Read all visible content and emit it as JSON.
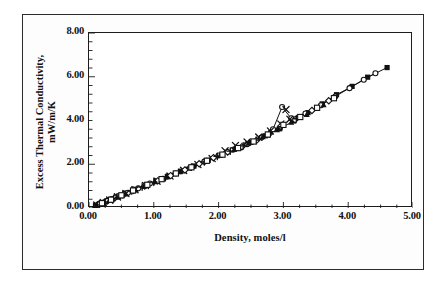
{
  "figure": {
    "kind": "scanned-scientific-chart",
    "background": "#ffffff",
    "border_color": "#2b2b2b"
  },
  "axes": {
    "y_title_line1": "Excess Thermal Conductivity,",
    "y_title_line2": "mW/m/K",
    "x_title": "Density, moles/l",
    "y_ticks": [
      "8.00",
      "6.00",
      "4.00",
      "2.00",
      "0.00"
    ],
    "x_ticks": [
      "0.00",
      "1.00",
      "2.00",
      "3.00",
      "4.00",
      "5.00"
    ]
  },
  "chart_data": {
    "type": "scatter",
    "title": "",
    "subtitle": "",
    "xlabel": "Density, moles/l",
    "ylabel": "Excess Thermal Conductivity, mW/m/K",
    "xlim": [
      0.0,
      5.0
    ],
    "ylim": [
      0.0,
      8.0
    ],
    "x_major_step": 1.0,
    "y_major_step": 2.0,
    "x_minor_step": 0.25,
    "y_minor_step": 0.4,
    "grid": false,
    "legend": "none",
    "marker_color": "#111111",
    "line_color": "#111111",
    "annotations": [
      "Divergent upper branch of open-circle and x-cross points near density 3.0, excess conductivity 4.5-4.7",
      "Data collapse onto a single near-linear excess-conductivity curve"
    ],
    "series": [
      {
        "name": "series-1-filled-square",
        "marker": "filled-square",
        "connected": true,
        "points": [
          [
            0.1,
            0.12
          ],
          [
            0.18,
            0.2
          ],
          [
            0.27,
            0.31
          ],
          [
            0.36,
            0.42
          ],
          [
            0.46,
            0.55
          ],
          [
            0.58,
            0.68
          ],
          [
            0.72,
            0.85
          ],
          [
            0.88,
            1.05
          ],
          [
            1.04,
            1.24
          ],
          [
            1.22,
            1.45
          ],
          [
            1.42,
            1.68
          ],
          [
            1.62,
            1.92
          ],
          [
            1.84,
            2.18
          ],
          [
            2.06,
            2.44
          ],
          [
            2.28,
            2.72
          ],
          [
            2.5,
            3.0
          ],
          [
            2.72,
            3.3
          ],
          [
            2.94,
            3.62
          ],
          [
            3.16,
            3.98
          ],
          [
            3.38,
            4.36
          ],
          [
            3.6,
            4.76
          ],
          [
            3.82,
            5.18
          ],
          [
            4.06,
            5.56
          ],
          [
            4.3,
            5.98
          ],
          [
            4.6,
            6.42
          ]
        ]
      },
      {
        "name": "series-2-open-circle",
        "marker": "open-circle",
        "connected": true,
        "points": [
          [
            0.14,
            0.16
          ],
          [
            0.24,
            0.27
          ],
          [
            0.34,
            0.39
          ],
          [
            0.46,
            0.54
          ],
          [
            0.6,
            0.7
          ],
          [
            0.76,
            0.9
          ],
          [
            0.94,
            1.12
          ],
          [
            1.14,
            1.34
          ],
          [
            1.34,
            1.58
          ],
          [
            1.56,
            1.84
          ],
          [
            1.78,
            2.12
          ],
          [
            2.0,
            2.4
          ],
          [
            2.22,
            2.66
          ],
          [
            2.44,
            2.92
          ],
          [
            2.66,
            3.22
          ],
          [
            2.84,
            3.6
          ],
          [
            2.98,
            4.62
          ],
          [
            3.12,
            4.1
          ],
          [
            3.34,
            4.32
          ],
          [
            3.58,
            4.7
          ],
          [
            3.8,
            5.1
          ],
          [
            4.02,
            5.48
          ],
          [
            4.24,
            5.86
          ],
          [
            4.42,
            6.16
          ]
        ]
      },
      {
        "name": "series-3-x-cross",
        "marker": "x-cross",
        "connected": false,
        "points": [
          [
            0.12,
            0.13
          ],
          [
            0.22,
            0.25
          ],
          [
            0.32,
            0.36
          ],
          [
            0.44,
            0.51
          ],
          [
            0.57,
            0.66
          ],
          [
            0.71,
            0.84
          ],
          [
            0.87,
            1.03
          ],
          [
            1.05,
            1.23
          ],
          [
            1.25,
            1.46
          ],
          [
            1.46,
            1.72
          ],
          [
            1.68,
            1.99
          ],
          [
            1.9,
            2.26
          ],
          [
            2.1,
            2.62
          ],
          [
            2.26,
            2.86
          ],
          [
            2.44,
            3.02
          ],
          [
            2.62,
            3.24
          ],
          [
            2.8,
            3.52
          ],
          [
            2.96,
            3.84
          ],
          [
            3.04,
            4.5
          ],
          [
            3.1,
            4.06
          ]
        ]
      },
      {
        "name": "series-4-open-diamond",
        "marker": "open-diamond",
        "connected": false,
        "points": [
          [
            0.16,
            0.18
          ],
          [
            0.28,
            0.32
          ],
          [
            0.4,
            0.47
          ],
          [
            0.54,
            0.63
          ],
          [
            0.69,
            0.81
          ],
          [
            0.86,
            1.01
          ],
          [
            1.06,
            1.24
          ],
          [
            1.26,
            1.48
          ],
          [
            1.48,
            1.74
          ],
          [
            1.7,
            2.02
          ],
          [
            1.92,
            2.3
          ],
          [
            2.14,
            2.56
          ],
          [
            2.36,
            2.8
          ],
          [
            2.58,
            3.08
          ],
          [
            2.78,
            3.38
          ],
          [
            2.96,
            3.74
          ],
          [
            3.18,
            4.04
          ],
          [
            3.44,
            4.46
          ],
          [
            3.7,
            4.9
          ]
        ]
      },
      {
        "name": "series-5-filled-triangle",
        "marker": "filled-triangle",
        "connected": false,
        "points": [
          [
            0.09,
            0.1
          ],
          [
            0.2,
            0.23
          ],
          [
            0.31,
            0.35
          ],
          [
            0.43,
            0.5
          ],
          [
            0.56,
            0.65
          ],
          [
            0.7,
            0.83
          ],
          [
            0.85,
            1.0
          ],
          [
            1.02,
            1.2
          ],
          [
            1.2,
            1.42
          ],
          [
            1.4,
            1.66
          ],
          [
            1.6,
            1.9
          ],
          [
            1.8,
            2.14
          ],
          [
            2.02,
            2.4
          ],
          [
            2.24,
            2.68
          ],
          [
            2.46,
            2.96
          ],
          [
            2.68,
            3.26
          ],
          [
            2.9,
            3.58
          ],
          [
            3.12,
            3.92
          ],
          [
            3.36,
            4.28
          ],
          [
            3.62,
            4.72
          ]
        ]
      },
      {
        "name": "series-6-plus-cross",
        "marker": "plus-cross",
        "connected": false,
        "points": [
          [
            0.13,
            0.14
          ],
          [
            0.25,
            0.28
          ],
          [
            0.38,
            0.44
          ],
          [
            0.52,
            0.61
          ],
          [
            0.66,
            0.78
          ],
          [
            0.82,
            0.96
          ],
          [
            1.0,
            1.18
          ],
          [
            1.18,
            1.39
          ],
          [
            1.38,
            1.63
          ],
          [
            1.58,
            1.87
          ],
          [
            1.78,
            2.11
          ],
          [
            1.98,
            2.36
          ],
          [
            2.18,
            2.6
          ],
          [
            2.38,
            2.84
          ],
          [
            2.58,
            3.1
          ],
          [
            2.78,
            3.4
          ],
          [
            2.98,
            3.72
          ],
          [
            3.2,
            4.08
          ]
        ]
      },
      {
        "name": "series-7-open-square",
        "marker": "open-square",
        "connected": false,
        "points": [
          [
            0.2,
            0.22
          ],
          [
            0.34,
            0.38
          ],
          [
            0.5,
            0.58
          ],
          [
            0.68,
            0.8
          ],
          [
            0.9,
            1.06
          ],
          [
            1.12,
            1.32
          ],
          [
            1.34,
            1.58
          ],
          [
            1.58,
            1.86
          ],
          [
            1.82,
            2.16
          ],
          [
            2.06,
            2.44
          ],
          [
            2.3,
            2.74
          ],
          [
            2.54,
            3.04
          ],
          [
            2.76,
            3.36
          ],
          [
            3.0,
            3.8
          ],
          [
            3.26,
            4.16
          ],
          [
            3.52,
            4.58
          ],
          [
            3.78,
            5.02
          ]
        ]
      }
    ]
  }
}
